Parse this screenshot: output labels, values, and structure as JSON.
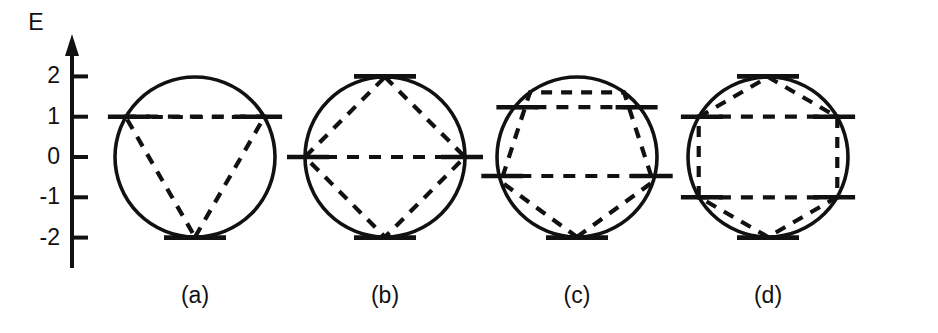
{
  "figure": {
    "kind": "frost-musulin-circle-diagram",
    "background_color": "#ffffff",
    "ink_color": "#111111",
    "width": 938,
    "height": 333
  },
  "axis": {
    "title": "E",
    "title_x": 36,
    "title_y": 30,
    "x": 72,
    "y_top": 42,
    "y_bottom": 268,
    "tick_length": 16,
    "tick_labels": [
      "2",
      "1",
      "0",
      "-1",
      "-2"
    ],
    "tick_values": [
      2,
      1,
      0,
      -1,
      -2
    ],
    "energy_zero_y": 157,
    "pixels_per_unit": 40.3
  },
  "chart_data": {
    "type": "diagram",
    "xlabel": "",
    "ylabel": "E",
    "ylim": [
      -2,
      2
    ],
    "ytick_labels": [
      "2",
      "1",
      "0",
      "-1",
      "-2"
    ],
    "grid": false,
    "legend": "none",
    "panels": [
      {
        "caption": "(a)",
        "ring_size": 3,
        "polygon": "triangle",
        "vertex_orientation": "apex-down",
        "center_x": 195,
        "radius": 80,
        "vertex_angles_deg": [
          -90,
          30,
          150
        ],
        "energy_levels": [
          {
            "energy": 1,
            "degeneracy": 2,
            "split": true
          },
          {
            "energy": -2,
            "degeneracy": 1,
            "split": false
          }
        ]
      },
      {
        "caption": "(b)",
        "ring_size": 4,
        "polygon": "square",
        "vertex_orientation": "apex-up",
        "center_x": 385,
        "radius": 80,
        "vertex_angles_deg": [
          90,
          0,
          -90,
          180
        ],
        "energy_levels": [
          {
            "energy": 2,
            "degeneracy": 1,
            "split": false
          },
          {
            "energy": 0,
            "degeneracy": 2,
            "split": true
          },
          {
            "energy": -2,
            "degeneracy": 1,
            "split": false
          }
        ]
      },
      {
        "caption": "(c)",
        "ring_size": 5,
        "polygon": "pentagon",
        "vertex_orientation": "apex-down",
        "center_x": 577,
        "radius": 80,
        "vertex_angles_deg": [
          -90,
          -18,
          54,
          126,
          198
        ],
        "energy_levels": [
          {
            "energy": 1.236,
            "degeneracy": 2,
            "split": true
          },
          {
            "energy": -0.472,
            "degeneracy": 2,
            "split": true
          },
          {
            "energy": -2,
            "degeneracy": 1,
            "split": false
          }
        ]
      },
      {
        "caption": "(d)",
        "ring_size": 6,
        "polygon": "hexagon",
        "vertex_orientation": "apex-up",
        "center_x": 768,
        "radius": 80,
        "vertex_angles_deg": [
          90,
          30,
          -30,
          -90,
          -150,
          150
        ],
        "energy_levels": [
          {
            "energy": 2,
            "degeneracy": 1,
            "split": false
          },
          {
            "energy": 1,
            "degeneracy": 2,
            "split": true
          },
          {
            "energy": -1,
            "degeneracy": 2,
            "split": true
          },
          {
            "energy": -2,
            "degeneracy": 1,
            "split": false
          }
        ]
      }
    ]
  },
  "captions": {
    "caption_y": 303,
    "items": [
      "(a)",
      "(b)",
      "(c)",
      "(d)"
    ]
  },
  "level_style": {
    "bar_half_length": 24,
    "bar_overhang": 18
  }
}
